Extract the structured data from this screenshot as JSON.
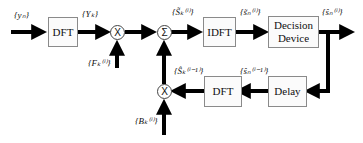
{
  "diagram": {
    "blocks": {
      "dft_top": "DFT",
      "idft": "IDFT",
      "decision_line1": "Decision",
      "decision_line2": "Device",
      "dft_bottom": "DFT",
      "delay": "Delay"
    },
    "nodes": {
      "multiply_top": "X",
      "sum": "Σ",
      "multiply_bottom": "X"
    },
    "labels": {
      "input": "{yₙ}",
      "dft_out": "{Yₖ}",
      "f_coeff": "{Fₖ⁽ⁱ⁾}",
      "sum_out": "{S̃ₖ⁽ⁱ⁾}",
      "idft_out": "{s̃ₙ⁽ⁱ⁾}",
      "decision_out": "{ŝₙ⁽ⁱ⁾}",
      "delay_out": "{ŝₙ⁽ⁱ⁻¹⁾}",
      "dft_bottom_out": "{Ŝₖ⁽ⁱ⁻¹⁾}",
      "b_coeff": "{Bₖ⁽ⁱ⁾}"
    },
    "colors": {
      "arrow": "#000000",
      "box_border": "#8a8a8a"
    }
  }
}
